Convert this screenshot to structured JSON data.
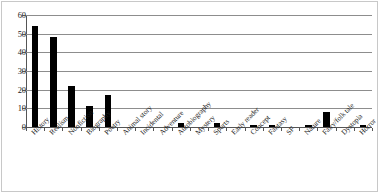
{
  "chart_data": {
    "type": "bar",
    "title": "",
    "subtitle": "",
    "xlabel": "",
    "ylabel": "",
    "ylim": [
      0,
      60
    ],
    "y_ticks": [
      0,
      10,
      20,
      30,
      40,
      50,
      60
    ],
    "grid": true,
    "grid_orientation": "horizontal",
    "legend": false,
    "legend_position": "none",
    "bar_color": "#000000",
    "grid_color": "#8d8d8d",
    "axis_color": "#555555",
    "categories": [
      "History",
      "Realism",
      "Nonfiction",
      "Biography",
      "Poetry",
      "Animal story",
      "Incidental",
      "Adventure",
      "Autobiography",
      "Mystery",
      "Sports",
      "Early reader",
      "Concept",
      "Fantasy",
      "SF",
      "Nature",
      "Fairy/folk tale",
      "Dystopia",
      "Horror"
    ],
    "values": [
      54,
      48,
      22,
      11,
      17,
      0,
      0,
      0,
      2,
      0,
      2,
      0,
      1,
      1,
      0,
      1,
      8,
      0,
      1
    ],
    "series": [
      {
        "name": "Count",
        "values": [
          54,
          48,
          22,
          11,
          17,
          0,
          0,
          0,
          2,
          0,
          2,
          0,
          1,
          1,
          0,
          1,
          8,
          0,
          1
        ]
      }
    ]
  }
}
